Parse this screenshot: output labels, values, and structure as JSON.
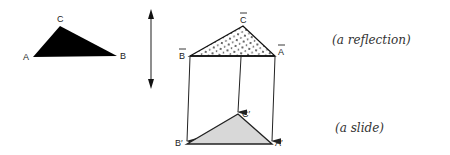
{
  "diagram": {
    "original_triangle": {
      "fill": "#000000",
      "vertices": {
        "A": [
          33,
          57
        ],
        "B": [
          117,
          56
        ],
        "C": [
          60,
          26
        ]
      },
      "labels": {
        "A": "A",
        "B": "B",
        "C": "C"
      }
    },
    "reflection_axis": {
      "type": "double-arrow",
      "x": 151,
      "y1": 10,
      "y2": 87
    },
    "reflected_triangle": {
      "fill": "dotted",
      "vertices": {
        "B": [
          190,
          56
        ],
        "C": [
          243,
          26
        ],
        "A": [
          275,
          56
        ]
      },
      "labels": {
        "A": "A",
        "B": "B",
        "C": "C"
      },
      "label_style": "overbar"
    },
    "slide_arrows": [
      {
        "from": [
          190,
          57
        ],
        "to": [
          187,
          141
        ]
      },
      {
        "from": [
          241,
          57
        ],
        "to": [
          238,
          112
        ]
      },
      {
        "from": [
          275,
          57
        ],
        "to": [
          272,
          141
        ]
      }
    ],
    "slid_triangle": {
      "fill": "#d8d8d8",
      "vertices": {
        "B": [
          187,
          144
        ],
        "C": [
          238,
          114
        ],
        "A": [
          272,
          144
        ]
      },
      "labels": {
        "A": "A′",
        "B": "B′",
        "C": "C′"
      }
    },
    "annotations": {
      "reflection": "(a reflection)",
      "slide": "(a slide)"
    }
  }
}
